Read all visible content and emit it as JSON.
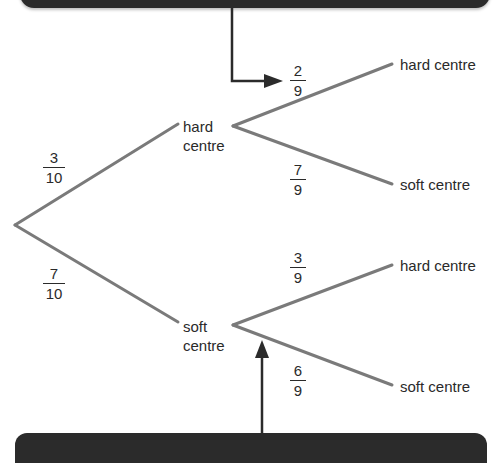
{
  "diagram": {
    "type": "probability-tree",
    "first_level": {
      "branches": [
        {
          "label": "hard\ncentre",
          "label_line1": "hard",
          "label_line2": "centre",
          "probability": {
            "num": "3",
            "den": "10"
          }
        },
        {
          "label": "soft\ncentre",
          "label_line1": "soft",
          "label_line2": "centre",
          "probability": {
            "num": "7",
            "den": "10"
          }
        }
      ]
    },
    "second_level": {
      "after_hard": [
        {
          "label": "hard centre",
          "probability": {
            "num": "2",
            "den": "9"
          }
        },
        {
          "label": "soft centre",
          "probability": {
            "num": "7",
            "den": "9"
          }
        }
      ],
      "after_soft": [
        {
          "label": "hard centre",
          "probability": {
            "num": "3",
            "den": "9"
          }
        },
        {
          "label": "soft centre",
          "probability": {
            "num": "6",
            "den": "9"
          }
        }
      ]
    },
    "callouts": {
      "top_arrow_target": "2/9",
      "bottom_arrow_target": "soft centre node"
    },
    "colors": {
      "branch": "#7a7a7a",
      "arrow": "#2b2b2b",
      "callout_bar": "#2b2b2b",
      "text": "#2a2a2a"
    }
  }
}
